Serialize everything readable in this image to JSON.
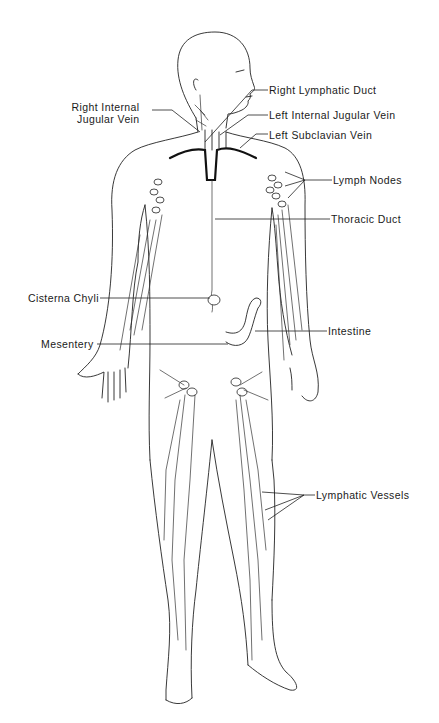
{
  "figure": {
    "labels": {
      "right_internal_jugular_vein": [
        "Right Internal",
        "Jugular Vein"
      ],
      "right_lymphatic_duct": "Right Lymphatic Duct",
      "left_internal_jugular_vein": "Left Internal Jugular Vein",
      "left_subclavian_vein": "Left Subclavian Vein",
      "lymph_nodes": "Lymph Nodes",
      "thoracic_duct": "Thoracic Duct",
      "cisterna_chyli": "Cisterna Chyli",
      "intestine": "Intestine",
      "mesentery": "Mesentery",
      "lymphatic_vessels": "Lymphatic Vessels"
    },
    "colors": {
      "line": "#222222",
      "background": "#ffffff"
    }
  }
}
